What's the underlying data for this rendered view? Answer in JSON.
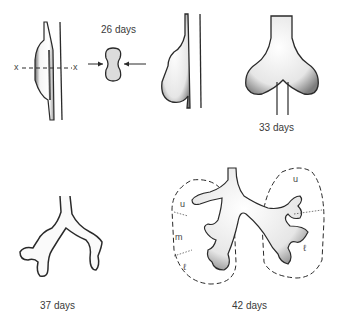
{
  "figure": {
    "stages": [
      {
        "id": "stage-26a",
        "label": "",
        "section_marker_left": "x",
        "section_marker_right": "x"
      },
      {
        "id": "stage-26b",
        "label": "26 days"
      },
      {
        "id": "stage-28",
        "label": ""
      },
      {
        "id": "stage-33",
        "label": "33 days"
      },
      {
        "id": "stage-37",
        "label": "37 days"
      },
      {
        "id": "stage-42",
        "label": "42 days",
        "lobe_labels_left": [
          "u",
          "m",
          "ℓ"
        ],
        "lobe_labels_right": [
          "u",
          "ℓ"
        ]
      }
    ]
  },
  "colors": {
    "outline": "#2a2a2a",
    "fill": "#f2f2f2",
    "shade": "#9a9a9a",
    "cross_section_fill": "#dcdcdc"
  }
}
